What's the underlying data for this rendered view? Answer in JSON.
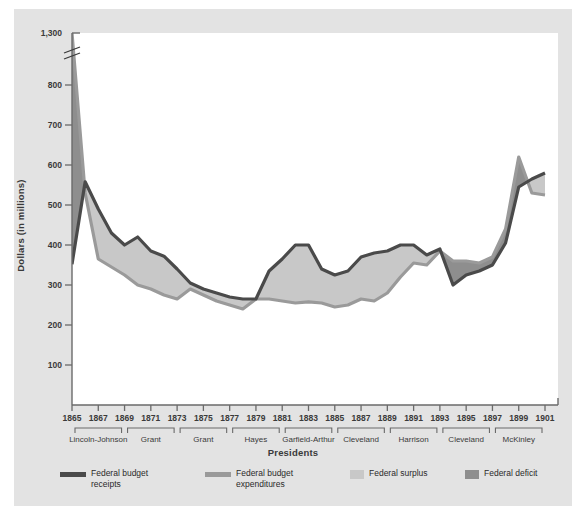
{
  "chart_data": {
    "type": "area",
    "title": "",
    "xlabel": "Presidents",
    "ylabel": "Dollars (in millions)",
    "x": [
      1865,
      1866,
      1867,
      1868,
      1869,
      1870,
      1871,
      1872,
      1873,
      1874,
      1875,
      1876,
      1877,
      1878,
      1879,
      1880,
      1881,
      1882,
      1883,
      1884,
      1885,
      1886,
      1887,
      1888,
      1889,
      1890,
      1891,
      1892,
      1893,
      1894,
      1895,
      1896,
      1897,
      1898,
      1899,
      1900,
      1901
    ],
    "ylim": [
      0,
      800
    ],
    "y_axis_break_above": 800,
    "y_top_value": 1300,
    "yticks": [
      "100",
      "200",
      "300",
      "400",
      "500",
      "600",
      "700",
      "800",
      "1,300"
    ],
    "xticks": [
      "1865",
      "1867",
      "1869",
      "1871",
      "1873",
      "1875",
      "1877",
      "1879",
      "1881",
      "1883",
      "1885",
      "1887",
      "1889",
      "1891",
      "1893",
      "1895",
      "1897",
      "1899",
      "1901"
    ],
    "grid": false,
    "legend_position": "bottom",
    "series": [
      {
        "name": "Federal budget receipts",
        "color": "#4a4a4a",
        "values": [
          352,
          558,
          490,
          430,
          400,
          420,
          385,
          372,
          340,
          305,
          290,
          280,
          270,
          265,
          265,
          335,
          365,
          400,
          400,
          340,
          325,
          335,
          370,
          380,
          385,
          400,
          400,
          375,
          390,
          300,
          325,
          335,
          350,
          405,
          545,
          565,
          580
        ]
      },
      {
        "name": "Federal budget expenditures",
        "color": "#9a9a9a",
        "values": [
          1300,
          530,
          365,
          345,
          325,
          300,
          290,
          275,
          265,
          290,
          275,
          260,
          250,
          240,
          265,
          265,
          260,
          255,
          258,
          255,
          245,
          250,
          265,
          260,
          280,
          320,
          355,
          350,
          385,
          360,
          360,
          355,
          370,
          440,
          620,
          530,
          525
        ]
      }
    ],
    "areas": [
      {
        "name": "Federal surplus",
        "color": "#c8c8c8",
        "definition": "receipts above expenditures"
      },
      {
        "name": "Federal deficit",
        "color": "#8e8e8e",
        "definition": "expenditures above receipts"
      }
    ],
    "eras": [
      {
        "label": "Lincoln-Johnson",
        "start": 1865,
        "end": 1869
      },
      {
        "label": "Grant",
        "start": 1869,
        "end": 1873
      },
      {
        "label": "Grant",
        "start": 1873,
        "end": 1877
      },
      {
        "label": "Hayes",
        "start": 1877,
        "end": 1881
      },
      {
        "label": "Garfield-Arthur",
        "start": 1881,
        "end": 1885
      },
      {
        "label": "Cleveland",
        "start": 1885,
        "end": 1889
      },
      {
        "label": "Harrison",
        "start": 1889,
        "end": 1893
      },
      {
        "label": "Cleveland",
        "start": 1893,
        "end": 1897
      },
      {
        "label": "McKinley",
        "start": 1897,
        "end": 1901
      }
    ]
  },
  "axes": {
    "y_title": "Dollars (in millions)",
    "x_title": "Presidents"
  },
  "legend": {
    "items": [
      {
        "label": "Federal budget\nreceipts",
        "color": "#4a4a4a",
        "style": "line"
      },
      {
        "label": "Federal budget\nexpenditures",
        "color": "#9a9a9a",
        "style": "line"
      },
      {
        "label": "Federal surplus",
        "color": "#c8c8c8",
        "style": "block"
      },
      {
        "label": "Federal deficit",
        "color": "#8e8e8e",
        "style": "block"
      }
    ]
  },
  "colors": {
    "panel_background": "#e3e3e3",
    "plot_background": "#ffffff",
    "receipts_line": "#4a4a4a",
    "expenditures_line": "#9a9a9a",
    "surplus_fill": "#c8c8c8",
    "deficit_fill": "#8e8e8e",
    "axis": "#6a6a6a",
    "text": "#3a3a3a"
  }
}
